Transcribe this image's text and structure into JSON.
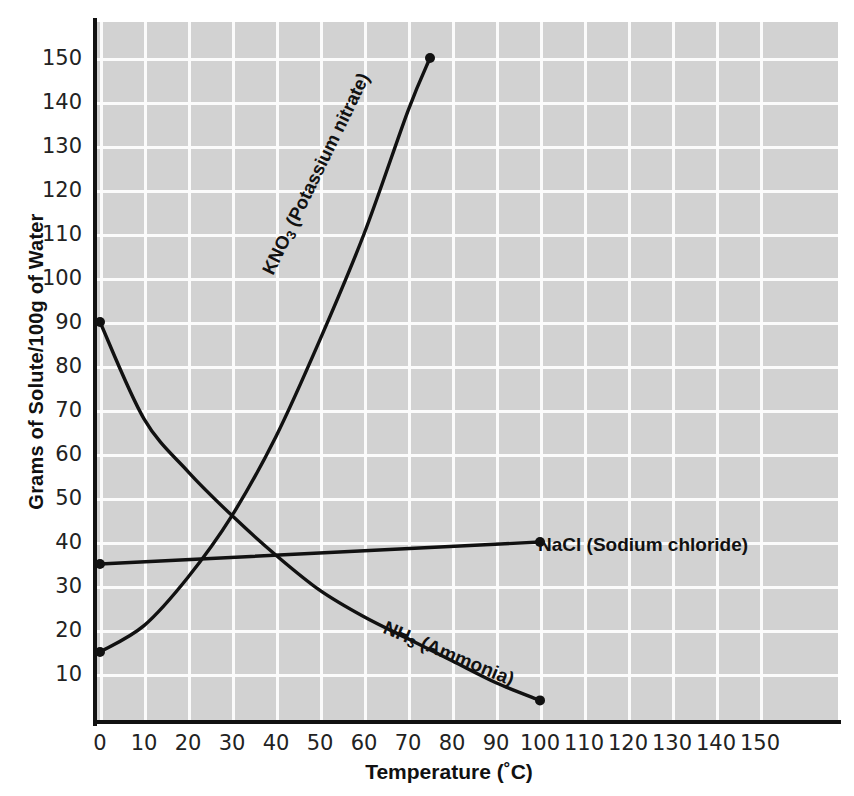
{
  "chart_data": {
    "type": "line",
    "title": "",
    "xlabel": "Temperature (˚C)",
    "ylabel": "Grams of Solute/100g of Water",
    "xlim": [
      0,
      160
    ],
    "ylim": [
      0,
      160
    ],
    "grid": true,
    "legend_position": "inline-annotations",
    "xticks": [
      "0",
      "10",
      "20",
      "30",
      "40",
      "50",
      "60",
      "70",
      "80",
      "90",
      "100",
      "110",
      "120",
      "130",
      "140",
      "150"
    ],
    "yticks": [
      "10",
      "20",
      "30",
      "40",
      "50",
      "60",
      "70",
      "80",
      "90",
      "100",
      "110",
      "120",
      "130",
      "140",
      "150"
    ],
    "series": [
      {
        "name": "KNO3 (Potassium nitrate)",
        "formula": "KNO3",
        "common_name": "Potassium nitrate",
        "color": "#111111",
        "x": [
          0,
          10,
          20,
          30,
          40,
          50,
          60,
          70,
          75
        ],
        "values": [
          15,
          21,
          32,
          46,
          64,
          86,
          110,
          138,
          150
        ],
        "endpoint_marker": true
      },
      {
        "name": "NaCl (Sodium chloride)",
        "formula": "NaCl",
        "common_name": "Sodium chloride",
        "color": "#111111",
        "x": [
          0,
          100
        ],
        "values": [
          35,
          40
        ],
        "endpoint_marker": true
      },
      {
        "name": "NH3 (Ammonia)",
        "formula": "NH3",
        "common_name": "Ammonia",
        "color": "#111111",
        "x": [
          0,
          10,
          20,
          30,
          40,
          50,
          60,
          70,
          80,
          90,
          100
        ],
        "values": [
          90,
          68,
          56,
          46,
          37,
          29,
          23,
          18,
          13,
          8,
          4
        ],
        "endpoint_marker": true
      }
    ]
  },
  "axes": {
    "x_title": "Temperature (˚C)",
    "y_title": "Grams of Solute/100g of Water"
  },
  "annotations": {
    "kno3_label": "KNO3 (Potassium nitrate)",
    "kno3_prefix": "KNO",
    "kno3_sub": "3",
    "kno3_suffix": " (Potassium nitrate)",
    "nacl_label": "NaCl (Sodium chloride)",
    "nh3_prefix": "NH",
    "nh3_sub": "3",
    "nh3_suffix": " (Ammonia)"
  },
  "style": {
    "plot_background": "#d2d2d2",
    "grid_color": "#fbfbfb",
    "line_color": "#111111",
    "page_background": "#ffffff"
  }
}
